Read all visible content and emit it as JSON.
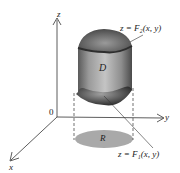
{
  "diagram": {
    "axes": {
      "z_label": "z",
      "y_label": "y",
      "x_label": "x",
      "origin_label": "0"
    },
    "solid_label": "D",
    "region_label": "R",
    "top_surface_label": "z = F₂(x, y)",
    "bottom_surface_label": "z = F₁(x, y)",
    "colors": {
      "axis": "#333333",
      "solid_side": "#9a9a9a",
      "solid_dark": "#3e3e3e",
      "region_fill": "#a9a9a9",
      "background": "#ffffff"
    }
  }
}
